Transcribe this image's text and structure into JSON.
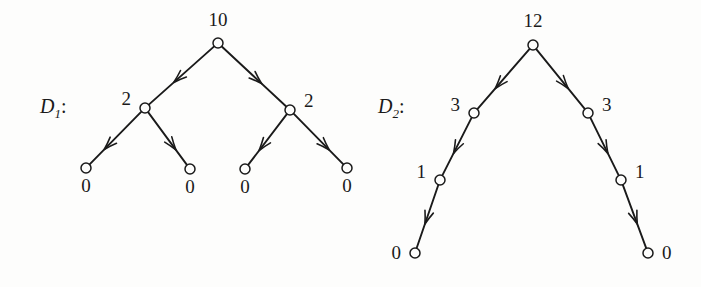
{
  "figure": {
    "background_color": "#fdfdfc",
    "ink_color": "#1a1a1a",
    "width": 701,
    "height": 287
  },
  "diagrams": [
    {
      "id": "D1",
      "label_letter": "D",
      "label_subscript": "1",
      "label_colon": ":",
      "label_x": 40,
      "label_y": 113,
      "nodes": [
        {
          "name": "d1-root",
          "value": "10",
          "cx": 218,
          "cy": 43,
          "r": 5.0,
          "label_x": 218,
          "label_y": 26,
          "label_anchor": "middle"
        },
        {
          "name": "d1-left-child",
          "value": "2",
          "cx": 145,
          "cy": 108,
          "r": 5.0,
          "label_x": 131,
          "label_y": 105,
          "label_anchor": "end"
        },
        {
          "name": "d1-right-child",
          "value": "2",
          "cx": 290,
          "cy": 110,
          "r": 5.0,
          "label_x": 304,
          "label_y": 107,
          "label_anchor": "start"
        },
        {
          "name": "d1-leaf-1",
          "value": "0",
          "cx": 86,
          "cy": 168,
          "r": 5.0,
          "label_x": 86,
          "label_y": 192,
          "label_anchor": "middle"
        },
        {
          "name": "d1-leaf-2",
          "value": "0",
          "cx": 190,
          "cy": 169,
          "r": 5.0,
          "label_x": 190,
          "label_y": 193,
          "label_anchor": "middle"
        },
        {
          "name": "d1-leaf-3",
          "value": "0",
          "cx": 245,
          "cy": 169,
          "r": 5.0,
          "label_x": 245,
          "label_y": 193,
          "label_anchor": "middle"
        },
        {
          "name": "d1-leaf-4",
          "value": "0",
          "cx": 347,
          "cy": 168,
          "r": 5.0,
          "label_x": 347,
          "label_y": 192,
          "label_anchor": "middle"
        }
      ],
      "edges": [
        {
          "name": "d1-edge-root-left",
          "from": "d1-root",
          "to": "d1-left-child",
          "arrow_t": 0.62
        },
        {
          "name": "d1-edge-root-right",
          "from": "d1-root",
          "to": "d1-right-child",
          "arrow_t": 0.62
        },
        {
          "name": "d1-edge-left-leaf1",
          "from": "d1-left-child",
          "to": "d1-leaf-1",
          "arrow_t": 0.72
        },
        {
          "name": "d1-edge-left-leaf2",
          "from": "d1-left-child",
          "to": "d1-leaf-2",
          "arrow_t": 0.72
        },
        {
          "name": "d1-edge-right-leaf3",
          "from": "d1-right-child",
          "to": "d1-leaf-3",
          "arrow_t": 0.72
        },
        {
          "name": "d1-edge-right-leaf4",
          "from": "d1-right-child",
          "to": "d1-leaf-4",
          "arrow_t": 0.72
        }
      ]
    },
    {
      "id": "D2",
      "label_letter": "D",
      "label_subscript": "2",
      "label_colon": ":",
      "label_x": 378,
      "label_y": 113,
      "nodes": [
        {
          "name": "d2-root",
          "value": "12",
          "cx": 533,
          "cy": 45,
          "r": 5.0,
          "label_x": 533,
          "label_y": 27,
          "label_anchor": "middle"
        },
        {
          "name": "d2-left-3",
          "value": "3",
          "cx": 474,
          "cy": 113,
          "r": 5.0,
          "label_x": 460,
          "label_y": 111,
          "label_anchor": "end"
        },
        {
          "name": "d2-right-3",
          "value": "3",
          "cx": 588,
          "cy": 113,
          "r": 5.0,
          "label_x": 602,
          "label_y": 111,
          "label_anchor": "start"
        },
        {
          "name": "d2-left-1",
          "value": "1",
          "cx": 440,
          "cy": 180,
          "r": 5.0,
          "label_x": 426,
          "label_y": 178,
          "label_anchor": "end"
        },
        {
          "name": "d2-right-1",
          "value": "1",
          "cx": 621,
          "cy": 180,
          "r": 5.0,
          "label_x": 635,
          "label_y": 178,
          "label_anchor": "start"
        },
        {
          "name": "d2-left-0",
          "value": "0",
          "cx": 415,
          "cy": 253,
          "r": 5.0,
          "label_x": 401,
          "label_y": 259,
          "label_anchor": "end"
        },
        {
          "name": "d2-right-0",
          "value": "0",
          "cx": 648,
          "cy": 253,
          "r": 5.0,
          "label_x": 662,
          "label_y": 259,
          "label_anchor": "start"
        }
      ],
      "edges": [
        {
          "name": "d2-edge-root-left3",
          "from": "d2-root",
          "to": "d2-left-3",
          "arrow_t": 0.66
        },
        {
          "name": "d2-edge-root-right3",
          "from": "d2-root",
          "to": "d2-right-3",
          "arrow_t": 0.66
        },
        {
          "name": "d2-edge-left3-left1",
          "from": "d2-left-3",
          "to": "d2-left-1",
          "arrow_t": 0.62
        },
        {
          "name": "d2-edge-right3-right1",
          "from": "d2-right-3",
          "to": "d2-right-1",
          "arrow_t": 0.62
        },
        {
          "name": "d2-edge-left1-left0",
          "from": "d2-left-1",
          "to": "d2-left-0",
          "arrow_t": 0.62
        },
        {
          "name": "d2-edge-right1-right0",
          "from": "d2-right-1",
          "to": "d2-right-0",
          "arrow_t": 0.62
        }
      ]
    }
  ],
  "chart_data": {
    "type": "diagram",
    "title": "",
    "graphs": [
      {
        "name": "D1",
        "node_values": [
          "10",
          "2",
          "2",
          "0",
          "0",
          "0",
          "0"
        ],
        "edges_as_values": [
          [
            "10",
            "2"
          ],
          [
            "10",
            "2"
          ],
          [
            "2",
            "0"
          ],
          [
            "2",
            "0"
          ],
          [
            "2",
            "0"
          ],
          [
            "2",
            "0"
          ]
        ]
      },
      {
        "name": "D2",
        "node_values": [
          "12",
          "3",
          "3",
          "1",
          "1",
          "0",
          "0"
        ],
        "edges_as_values": [
          [
            "12",
            "3"
          ],
          [
            "12",
            "3"
          ],
          [
            "3",
            "1"
          ],
          [
            "3",
            "1"
          ],
          [
            "1",
            "0"
          ],
          [
            "1",
            "0"
          ]
        ]
      }
    ]
  }
}
